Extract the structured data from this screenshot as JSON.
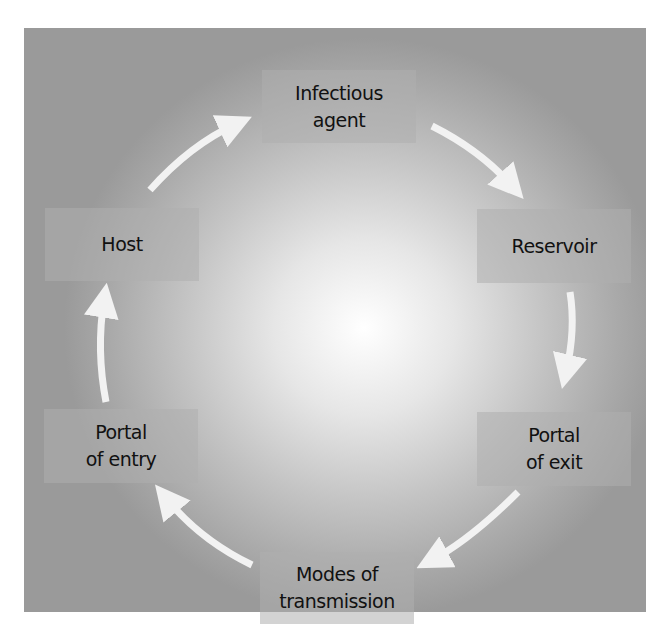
{
  "diagram": {
    "nodes": [
      {
        "id": "infectious-agent",
        "lines": [
          "Infectious",
          "agent"
        ]
      },
      {
        "id": "reservoir",
        "lines": [
          "Reservoir"
        ]
      },
      {
        "id": "portal-of-exit",
        "lines": [
          "Portal",
          "of exit"
        ]
      },
      {
        "id": "modes-of-transmission",
        "lines": [
          "Modes of",
          "transmission"
        ]
      },
      {
        "id": "portal-of-entry",
        "lines": [
          "Portal",
          "of entry"
        ]
      },
      {
        "id": "host",
        "lines": [
          "Host"
        ]
      }
    ],
    "edges": [
      {
        "from": "infectious-agent",
        "to": "reservoir"
      },
      {
        "from": "reservoir",
        "to": "portal-of-exit"
      },
      {
        "from": "portal-of-exit",
        "to": "modes-of-transmission"
      },
      {
        "from": "modes-of-transmission",
        "to": "portal-of-entry"
      },
      {
        "from": "portal-of-entry",
        "to": "host"
      },
      {
        "from": "host",
        "to": "infectious-agent"
      }
    ],
    "colors": {
      "arrow": "#f2f2f2",
      "box": "#b5b5b5",
      "text": "#111111"
    }
  }
}
